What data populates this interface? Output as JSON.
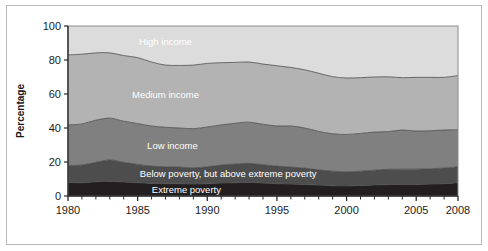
{
  "figure": {
    "background_color": "#ffffff",
    "frame_color": "#b9b9b9"
  },
  "chart_data": {
    "type": "area",
    "stacked": true,
    "title": "",
    "subtitle": "",
    "xlabel": "",
    "ylabel": "Percentage",
    "xlim": [
      1980,
      2008
    ],
    "ylim": [
      0,
      100
    ],
    "grid": false,
    "legend_position": "inline-band-labels",
    "x": [
      1980,
      1981,
      1982,
      1983,
      1984,
      1985,
      1986,
      1987,
      1988,
      1989,
      1990,
      1991,
      1992,
      1993,
      1994,
      1995,
      1996,
      1997,
      1998,
      1999,
      2000,
      2001,
      2002,
      2003,
      2004,
      2005,
      2006,
      2007,
      2008
    ],
    "xticks": [
      1980,
      1985,
      1990,
      1995,
      2000,
      2005,
      2008
    ],
    "xtick_labels": [
      "1980",
      "1985",
      "1990",
      "1995",
      "2000",
      "2005",
      "2008"
    ],
    "xticks_minor_step": 1,
    "yticks": [
      0,
      20,
      40,
      60,
      80,
      100
    ],
    "ytick_labels": [
      "0",
      "20",
      "40",
      "60",
      "80",
      "100"
    ],
    "series": [
      {
        "name": "Extreme poverty",
        "label": "Extreme poverty",
        "color": "#231f20",
        "label_color": "#ffffff",
        "values": [
          8.0,
          7.8,
          8.4,
          8.6,
          8.2,
          7.8,
          7.4,
          7.2,
          7.2,
          7.0,
          7.2,
          7.6,
          7.8,
          8.0,
          7.6,
          7.2,
          7.0,
          6.8,
          6.4,
          6.0,
          5.9,
          6.2,
          6.5,
          6.7,
          6.8,
          6.8,
          7.0,
          7.2,
          7.8
        ]
      },
      {
        "name": "Below poverty, but above extreme poverty",
        "label": "Below poverty, but above extreme poverty",
        "color": "#4d4d4d",
        "label_color": "#ffffff",
        "values": [
          10.0,
          10.4,
          11.4,
          12.6,
          11.6,
          10.8,
          10.2,
          10.0,
          9.8,
          9.6,
          10.0,
          10.6,
          11.0,
          11.2,
          10.8,
          10.4,
          10.0,
          9.6,
          9.0,
          8.6,
          8.3,
          8.4,
          8.7,
          9.0,
          9.0,
          9.0,
          9.0,
          9.2,
          9.4
        ]
      },
      {
        "name": "Low income",
        "label": "Low income",
        "color": "#808080",
        "label_color": "#ffffff",
        "values": [
          23.8,
          24.2,
          24.8,
          24.6,
          24.2,
          24.0,
          23.6,
          23.2,
          23.0,
          23.0,
          23.4,
          23.6,
          24.0,
          24.2,
          23.8,
          23.6,
          24.2,
          23.6,
          22.6,
          22.0,
          22.0,
          22.2,
          22.4,
          22.2,
          23.0,
          22.4,
          22.4,
          22.4,
          21.8
        ]
      },
      {
        "name": "Medium income",
        "label": "Medium income",
        "color": "#b3b3b3",
        "label_color": "#ffffff",
        "values": [
          41.2,
          41.0,
          39.6,
          38.4,
          38.6,
          38.8,
          37.6,
          36.6,
          36.8,
          37.4,
          37.4,
          36.6,
          35.8,
          35.4,
          35.4,
          35.4,
          34.4,
          34.2,
          34.2,
          33.6,
          33.2,
          32.8,
          32.4,
          32.2,
          30.8,
          31.6,
          31.4,
          31.0,
          31.8
        ]
      },
      {
        "name": "High income",
        "label": "High income",
        "color": "#dcdcdc",
        "label_color": "#ffffff",
        "values": [
          17.0,
          16.6,
          15.8,
          15.8,
          17.4,
          18.6,
          21.2,
          23.0,
          23.2,
          23.0,
          22.0,
          21.6,
          21.4,
          21.2,
          22.4,
          23.4,
          24.4,
          25.8,
          27.8,
          29.8,
          30.6,
          30.4,
          30.0,
          29.9,
          30.4,
          30.2,
          30.2,
          30.2,
          29.2
        ]
      }
    ],
    "band_label_positions": [
      {
        "name": "High income",
        "x": 1987.0,
        "y": 91.0
      },
      {
        "name": "Medium income",
        "x": 1987.0,
        "y": 59.5
      },
      {
        "name": "Low income",
        "x": 1987.5,
        "y": 30.0
      },
      {
        "name": "Below poverty, but above extreme poverty",
        "x": 1991.5,
        "y": 13.0
      },
      {
        "name": "Extreme poverty",
        "x": 1988.5,
        "y": 4.0
      }
    ]
  }
}
